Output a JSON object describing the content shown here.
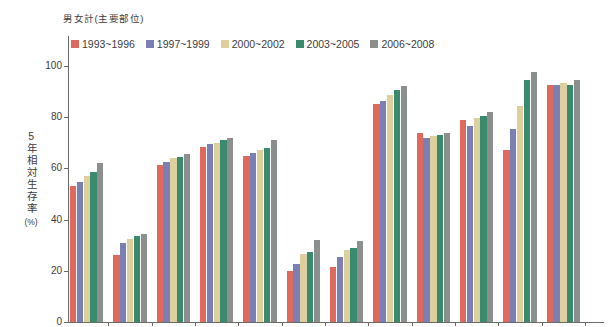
{
  "title": "男女計(主要部位)",
  "y_axis": {
    "label": "5年相対生存率",
    "unit": "(%)",
    "ticks": [
      "100",
      "80",
      "60",
      "40",
      "20",
      "0"
    ]
  },
  "note": "x-axis category labels are cropped out of the visible screenshot",
  "chart_data": {
    "type": "bar",
    "title": "男女計(主要部位)",
    "xlabel": "",
    "ylabel": "5年相対生存率(%)",
    "ylim": [
      0,
      100
    ],
    "grid": false,
    "legend_position": "top-left",
    "categories": [
      "",
      "",
      "",
      "",
      "",
      "",
      "",
      "",
      "",
      "",
      "",
      ""
    ],
    "series": [
      {
        "name": "1993~1996",
        "color": "#e0695e",
        "values": [
          53,
          26,
          61.5,
          68.5,
          65,
          20,
          21.5,
          85,
          74,
          79,
          67,
          92.5
        ]
      },
      {
        "name": "1997~1999",
        "color": "#7b80b4",
        "values": [
          54.5,
          31,
          62.5,
          69.5,
          66,
          22.5,
          25.5,
          86.5,
          72,
          76.5,
          75.5,
          92.5
        ]
      },
      {
        "name": "2000~2002",
        "color": "#ddcf9e",
        "values": [
          57,
          32.5,
          64,
          70,
          67,
          26.5,
          28,
          88.5,
          72.5,
          79.5,
          84.5,
          93.5
        ]
      },
      {
        "name": "2003~2005",
        "color": "#3a8a6e",
        "values": [
          58.5,
          33.5,
          64.5,
          71,
          68,
          27.5,
          29,
          90.5,
          73,
          80.5,
          94.5,
          92.5
        ]
      },
      {
        "name": "2006~2008",
        "color": "#8b908e",
        "values": [
          62,
          34.5,
          65.5,
          72,
          71,
          32,
          31.5,
          92,
          74,
          82,
          97.5,
          94.5
        ]
      }
    ]
  }
}
